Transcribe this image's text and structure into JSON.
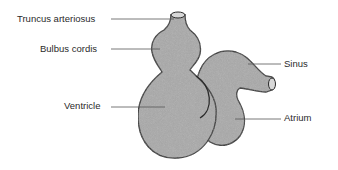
{
  "diagram": {
    "colors": {
      "fill": "#a9a9a9",
      "outline": "#2b2b2b",
      "leader": "#555555",
      "text": "#2a2a2a"
    },
    "labels": {
      "truncus": "Truncus arteriosus",
      "bulbus": "Bulbus cordis",
      "ventricle": "Ventricle",
      "sinus": "Sinus",
      "atrium": "Atrium"
    }
  }
}
